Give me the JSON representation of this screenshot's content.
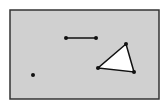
{
  "diagram": {
    "canvas": {
      "x": 10,
      "y": 10,
      "width": 149,
      "height": 89,
      "fill": "#d0d0d0",
      "stroke": "#333333"
    },
    "point": {
      "x": 33,
      "y": 75
    },
    "segment": {
      "x1": 66,
      "y1": 38,
      "x2": 96,
      "y2": 38
    },
    "triangle": {
      "points": [
        [
          126,
          44
        ],
        [
          98,
          68
        ],
        [
          134,
          72
        ]
      ],
      "fill": "#ffffff"
    },
    "colors": {
      "ink": "#111111"
    }
  }
}
